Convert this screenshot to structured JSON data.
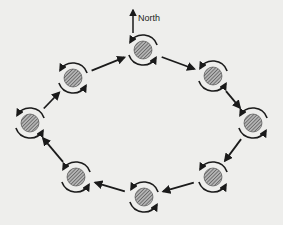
{
  "title": "",
  "compass": {
    "label": "North",
    "x": 141,
    "y": 19
  },
  "colors": {
    "background": "#eeeeec",
    "ink": "#1a1a1a",
    "fill": "#888888"
  },
  "nodes": [
    {
      "id": "top",
      "x": 143,
      "y": 50
    },
    {
      "id": "upper-right",
      "x": 213,
      "y": 76
    },
    {
      "id": "right",
      "x": 253,
      "y": 123
    },
    {
      "id": "lower-right",
      "x": 213,
      "y": 177
    },
    {
      "id": "bottom",
      "x": 144,
      "y": 197
    },
    {
      "id": "lower-left",
      "x": 76,
      "y": 177
    },
    {
      "id": "left",
      "x": 30,
      "y": 123
    },
    {
      "id": "upper-left",
      "x": 73,
      "y": 78
    }
  ],
  "path_direction": "clockwise",
  "rotation_direction": "counterclockwise"
}
